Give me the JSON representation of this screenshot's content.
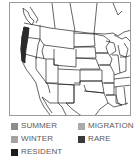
{
  "map": {
    "region": "western-and-central-united-states",
    "range_highlight": {
      "area": "pacific-coast",
      "category": "RESIDENT",
      "color": "#2a2a2a"
    }
  },
  "legend": {
    "items": [
      {
        "label": "SUMMER",
        "color": "#8c8c8c"
      },
      {
        "label": "MIGRATION",
        "color": "#ababab"
      },
      {
        "label": "WINTER",
        "color": "#a3a3a3"
      },
      {
        "label": "RARE",
        "color": "#3a3a3a"
      },
      {
        "label": "RESIDENT",
        "color": "#1c1c1c"
      }
    ]
  }
}
